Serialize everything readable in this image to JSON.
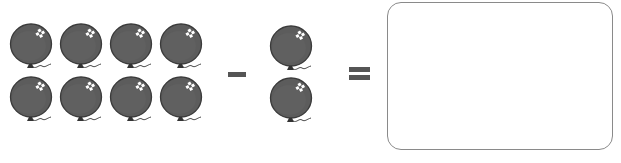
{
  "equation": {
    "minuend": {
      "count": 8,
      "rows": 2,
      "cols": 4,
      "item": "balloon-icon"
    },
    "operator1": "minus",
    "subtrahend": {
      "count": 2,
      "rows": 2,
      "cols": 1,
      "item": "balloon-icon"
    },
    "operator2": "equals",
    "answer": {
      "value": ""
    }
  },
  "colors": {
    "balloon_fill": "#5c5c5c",
    "balloon_outline": "#3a3a3a",
    "operator": "#555555",
    "box_border": "#8a8a8a"
  }
}
